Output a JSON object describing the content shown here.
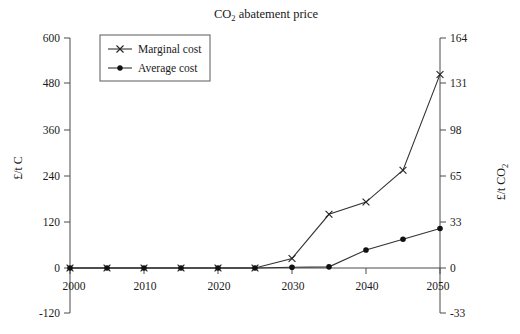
{
  "chart_data": {
    "type": "line",
    "title": "CO2 abatement price",
    "title_main": "CO",
    "title_sub": "2",
    "title_rest": " abatement price",
    "xlabel": "",
    "ylabel": "£/t C",
    "ylabel_right_main": "£/t CO",
    "ylabel_right_sub": "2",
    "x": [
      2000,
      2005,
      2010,
      2015,
      2020,
      2025,
      2030,
      2035,
      2040,
      2045,
      2050
    ],
    "xtick_labels": [
      "2000",
      "2010",
      "2020",
      "2030",
      "2040",
      "2050"
    ],
    "xticks": [
      2000,
      2010,
      2020,
      2030,
      2040,
      2050
    ],
    "xlim": [
      2000,
      2050
    ],
    "ylim": [
      -120,
      600
    ],
    "yticks": [
      -120,
      0,
      120,
      240,
      360,
      480,
      600
    ],
    "ytick_labels": [
      "-120",
      "0",
      "120",
      "240",
      "360",
      "480",
      "600"
    ],
    "ylim_right": [
      -33,
      164
    ],
    "yticks_right": [
      -33,
      0,
      33,
      65,
      98,
      131,
      164
    ],
    "ytick_labels_right": [
      "-33",
      "0",
      "33",
      "65",
      "98",
      "131",
      "164"
    ],
    "grid": false,
    "legend_position": "upper left",
    "series": [
      {
        "name": "Marginal cost",
        "marker": "x",
        "values": [
          0,
          0,
          0,
          0,
          0,
          0,
          25,
          140,
          172,
          255,
          505
        ]
      },
      {
        "name": "Average cost",
        "marker": "o",
        "values": [
          0,
          0,
          0,
          0,
          0,
          0,
          2,
          3,
          47,
          75,
          103
        ]
      }
    ]
  },
  "legend": {
    "items": [
      {
        "label": "Marginal cost",
        "marker": "x"
      },
      {
        "label": "Average cost",
        "marker": "o"
      }
    ]
  }
}
